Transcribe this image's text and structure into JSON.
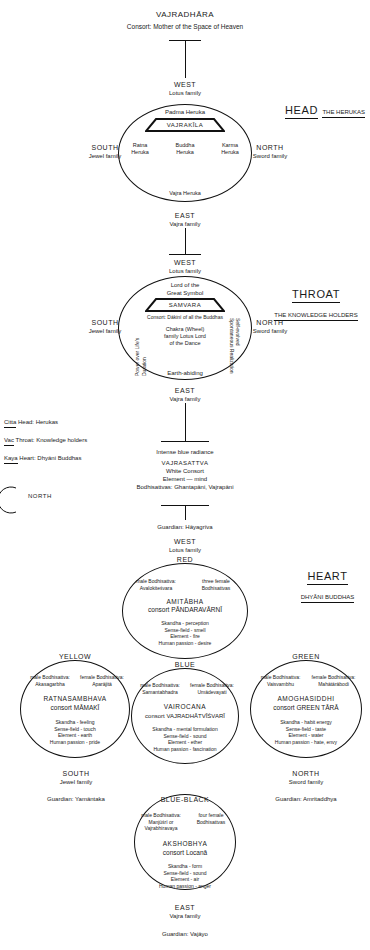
{
  "top": {
    "title": "VAJRADHĀRA",
    "consort": "Consort: Mother of the Space of Heaven"
  },
  "head_section": {
    "label": "HEAD",
    "sublabel": "THE HERUKAS",
    "top_direction": "WEST",
    "top_family": "Lotus family",
    "bottom_direction": "EAST",
    "bottom_family": "Vajra family",
    "left_direction": "SOUTH",
    "left_family": "Jewel family",
    "right_direction": "NORTH",
    "right_family": "Sword family",
    "circle": {
      "top_figure": "Padma Heruka",
      "banner": "VAJRAKĪLA",
      "left_figure": "Ratna\nHeruka",
      "center_figure": "Buddha\nHeruka",
      "right_figure": "Karma\nHeruka",
      "bottom_figure": "Vajra Heruka"
    }
  },
  "throat_section": {
    "label": "THROAT",
    "sublabel": "THE KNOWLEDGE HOLDERS",
    "top_direction": "WEST",
    "top_family": "Lotus family",
    "bottom_direction": "EAST",
    "bottom_family": "Vajra family",
    "left_direction": "SOUTH",
    "left_family": "Jewel family",
    "right_direction": "NORTH",
    "right_family": "Sword family",
    "circle": {
      "top_figure_line1": "Lord of the",
      "top_figure_line2": "Great Symbol",
      "banner": "SAMVARA",
      "consort": "Consort: Dākinī of all the Buddhas",
      "center_line1": "Chakra (Wheel)",
      "center_line2": "family Lotus Lord",
      "center_line3": "of the Dance",
      "left_vertical": "Power over Life's Duration",
      "right_vertical": "Self-evolved Spontaneous Realization",
      "bottom_figure": "Earth-abiding"
    }
  },
  "legend": [
    {
      "term": "Citta",
      "text": "Head: Herukas"
    },
    {
      "term": "Vac",
      "text": "Throat: Knowledge holders"
    },
    {
      "term": "Kaya",
      "text": "Heart: Dhyāni Buddhas"
    }
  ],
  "vajrasattva": {
    "radiance": "Intense blue radiance",
    "name": "VAJRASATTVA",
    "consort": "White Consort",
    "element": "Element — mind",
    "bodhisattvas": "Bodhisattvas: Ghantapāni, Vajrapāni"
  },
  "heart_section": {
    "label": "HEART",
    "sublabel": "DHYĀNI BUDDHAS",
    "guardian_top": "Guardian: Hāyagrīva",
    "top_direction": "WEST",
    "top_family": "Lotus family",
    "bottom_direction": "EAST",
    "bottom_family": "Vajra family",
    "bottom_guardian": "Guardian: Vajāyo",
    "left_direction": "SOUTH",
    "left_family": "Jewel family",
    "left_guardian": "Guardian: Yamāntaka",
    "right_direction": "NORTH",
    "right_family": "Sword family",
    "right_guardian": "Guardian: Amritaddhya"
  },
  "buddhas": {
    "amitabha": {
      "color": "RED",
      "male_label": "male Bodhisattva:",
      "male_name": "Avalokiteśvara",
      "female_label": "three female",
      "female_name": "Bodhisattvas",
      "name": "AMITĀBHA",
      "consort": "consort PĀNDARAVĀRNĪ",
      "attrs": [
        "Skandha - perception",
        "Sense-field - smell",
        "Element - fire",
        "Human passion - desire"
      ]
    },
    "ratnasambhava": {
      "color": "YELLOW",
      "male_label": "male Bodhisattva:",
      "male_name": "Akasagarbha",
      "female_label": "female Bodhisattva:",
      "female_name": "Aparājitā",
      "name": "RATNASAMBHAVA",
      "consort": "consort MĀMAKĪ",
      "attrs": [
        "Skandha - feeling",
        "Sense-field - touch",
        "Element - earth",
        "Human passion - pride"
      ]
    },
    "vairocana": {
      "color": "BLUE",
      "male_label": "male Bodhisattva:",
      "male_name": "Samantabhadra",
      "female_label": "female Bodhisattva:",
      "female_name": "Umādevayati",
      "name": "VAIROCANA",
      "consort": "consort VAJRADHĀTVĪŚVARĪ",
      "attrs": [
        "Skandha - mental formulation",
        "Sense-field  - sound",
        "Element - ether",
        "Human passion - fascination"
      ]
    },
    "amoghasiddhi": {
      "color": "GREEN",
      "male_label": "male Bodhisattva:",
      "male_name": "Vaisvambhu",
      "female_label": "female Bodhisattva:",
      "female_name": "Mahātārābodi",
      "name": "AMOGHASIDDHI",
      "consort": "consort GREEN TĀRĀ",
      "attrs": [
        "Skandha - habit energy",
        "Sense-field - taste",
        "Element - water",
        "Human passion - hate, envy"
      ]
    },
    "akshobhya": {
      "color": "BLUE-BLACK",
      "male_label": "male Bodhisattva:",
      "male_name": "Manjūśrī or\nVajrabhiravaya",
      "female_label": "four female",
      "female_name": "Bodhisattvas",
      "name": "AKSHOBHYA",
      "consort": "consort Locanā",
      "attrs": [
        "Skandha - form",
        "Sense-field - sound",
        "Element - air",
        "Human passion - anger"
      ]
    }
  },
  "side_mark": {
    "north": "NORTH"
  }
}
